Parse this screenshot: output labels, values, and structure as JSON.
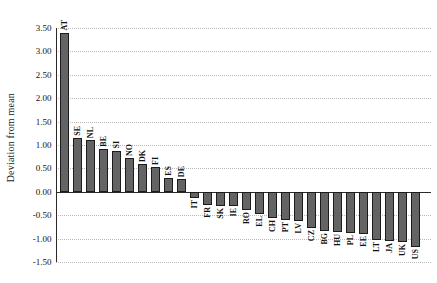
{
  "chart_data": {
    "type": "bar",
    "title": "",
    "xlabel": "",
    "ylabel": "Deviation from mean",
    "categories": [
      "AT",
      "SE",
      "NL",
      "BE",
      "SI",
      "NO",
      "DK",
      "FI",
      "ES",
      "DE",
      "IT",
      "FR",
      "SK",
      "IE",
      "RO",
      "EL",
      "CH",
      "PT",
      "LV",
      "CZ",
      "BG",
      "HU",
      "PL",
      "EE",
      "LT",
      "JA",
      "UK",
      "US"
    ],
    "values": [
      3.4,
      1.15,
      1.1,
      0.92,
      0.88,
      0.72,
      0.6,
      0.54,
      0.29,
      0.27,
      -0.13,
      -0.28,
      -0.3,
      -0.31,
      -0.38,
      -0.48,
      -0.57,
      -0.6,
      -0.63,
      -0.77,
      -0.83,
      -0.86,
      -0.88,
      -0.9,
      -1.02,
      -1.05,
      -1.08,
      -1.17
    ],
    "ylim": [
      -1.5,
      3.5
    ],
    "ytick_step": 0.5,
    "ytick_labels": [
      "3.50",
      "3.00",
      "2.50",
      "2.00",
      "1.50",
      "1.00",
      "0.50",
      "0.00",
      "-0.50",
      "-1.00",
      "-1.50"
    ],
    "grid": "horizontal-dotted",
    "legend": "none",
    "bar_label_rotation_deg": -90,
    "colors": {
      "bar_fill": "#646464",
      "bar_border": "#1c1c1c",
      "axis": "#2a2a2a",
      "gridline": "#b9b9b9",
      "text": "#111111",
      "background": "#ffffff"
    }
  }
}
